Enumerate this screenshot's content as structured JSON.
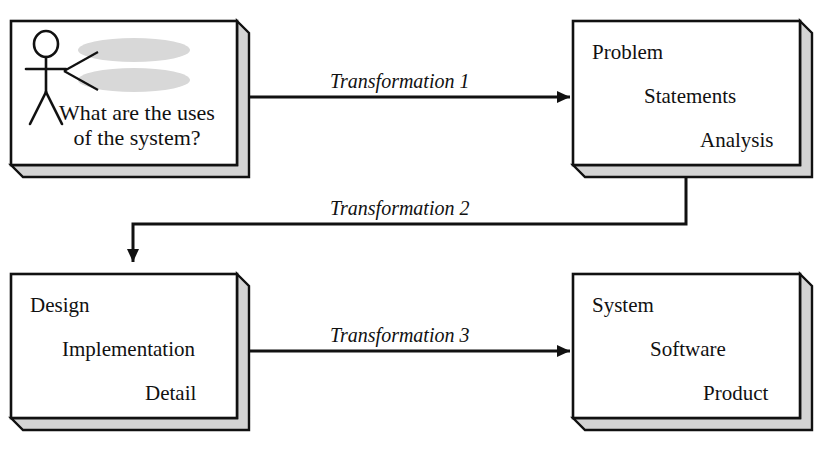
{
  "diagram": {
    "colors": {
      "stroke": "#111111",
      "shadow_fill": "#d4d4d4",
      "ellipse_fill": "#d8d8d8",
      "box_fill": "#ffffff",
      "background": "#ffffff"
    },
    "boxes": [
      {
        "id": "use-case-box",
        "name": "use-case-box",
        "question_line1": "What are the uses",
        "question_line2": "of the system?",
        "actor_name": "actor-stick-figure",
        "ellipses": [
          "use-case-ellipse-top",
          "use-case-ellipse-bottom"
        ]
      },
      {
        "id": "problem-box",
        "name": "problem-statements-analysis-box",
        "lines": [
          "Problem",
          "Statements",
          "Analysis"
        ]
      },
      {
        "id": "design-box",
        "name": "design-implementation-detail-box",
        "lines": [
          "Design",
          "Implementation",
          "Detail"
        ]
      },
      {
        "id": "system-box",
        "name": "system-software-product-box",
        "lines": [
          "System",
          "Software",
          "Product"
        ]
      }
    ],
    "arrows": [
      {
        "id": "transformation-1",
        "label": "Transformation 1",
        "from": "use-case-box",
        "to": "problem-box"
      },
      {
        "id": "transformation-2",
        "label": "Transformation 2",
        "from": "problem-box",
        "to": "design-box"
      },
      {
        "id": "transformation-3",
        "label": "Transformation 3",
        "from": "design-box",
        "to": "system-box"
      }
    ]
  }
}
